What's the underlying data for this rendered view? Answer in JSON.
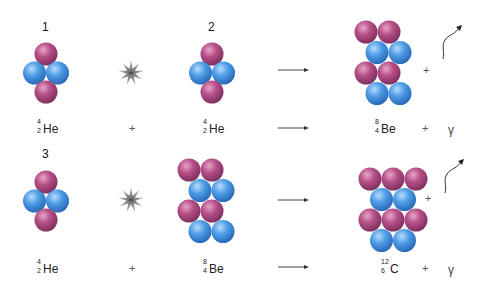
{
  "colors": {
    "proton": "#b34d86",
    "neutron": "#4f9de6",
    "background": "#ffffff"
  },
  "reactions": [
    {
      "step_label": "1",
      "reactant1": {
        "mass": "4",
        "atomic": "2",
        "symbol": "He",
        "nucleus": "helium-4"
      },
      "operator": "+",
      "reactant2": {
        "mass": "4",
        "atomic": "2",
        "symbol": "He",
        "nucleus": "helium-4"
      },
      "product": {
        "mass": "8",
        "atomic": "4",
        "symbol": "Be",
        "nucleus": "beryllium-8"
      },
      "product_plus": "+",
      "emission": "γ"
    },
    {
      "step_label": "3",
      "reactant1": {
        "mass": "4",
        "atomic": "2",
        "symbol": "He",
        "nucleus": "helium-4"
      },
      "operator": "+",
      "reactant2": {
        "mass": "8",
        "atomic": "4",
        "symbol": "Be",
        "nucleus": "beryllium-8"
      },
      "product": {
        "mass": "12",
        "atomic": "6",
        "symbol": "C",
        "nucleus": "carbon-12"
      },
      "product_plus": "+",
      "emission": "γ"
    }
  ],
  "step2_label": "2",
  "icons": {
    "collision": "starburst-icon",
    "arrow": "reaction-arrow-icon",
    "photon": "wavy-photon-arrow-icon"
  }
}
